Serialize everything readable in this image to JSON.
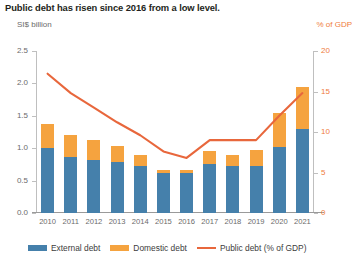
{
  "chart_data": {
    "type": "bar",
    "title": "Public debt has risen since 2016 from a low level.",
    "ylabel": "SI$ billion",
    "ylabel_right": "% of GDP",
    "xlabel": "",
    "categories": [
      "2010",
      "2011",
      "2012",
      "2013",
      "2014",
      "2015",
      "2016",
      "2017",
      "2018",
      "2019",
      "2020",
      "2021"
    ],
    "ylim": [
      0,
      2.5
    ],
    "ylim_right": [
      0,
      20
    ],
    "yticks": [
      "0.0",
      "0.5",
      "1.0",
      "1.5",
      "2.0",
      "2.5"
    ],
    "yticks_right": [
      "0",
      "5",
      "10",
      "15",
      "20"
    ],
    "grid": false,
    "legend_position": "bottom",
    "series": [
      {
        "name": "External debt",
        "type": "bar",
        "color": "#4580ab",
        "axis": "left",
        "values": [
          1.0,
          0.86,
          0.82,
          0.78,
          0.73,
          0.62,
          0.62,
          0.75,
          0.72,
          0.72,
          1.02,
          1.3
        ]
      },
      {
        "name": "Domestic debt",
        "type": "bar",
        "color": "#f5a33f",
        "axis": "left",
        "values": [
          0.38,
          0.34,
          0.31,
          0.26,
          0.17,
          0.05,
          0.05,
          0.21,
          0.17,
          0.25,
          0.52,
          0.65
        ]
      },
      {
        "name": "Public debt (% of GDP)",
        "type": "line",
        "color": "#e8673c",
        "axis": "right",
        "values": [
          17.2,
          14.8,
          13.0,
          11.2,
          9.6,
          7.6,
          6.8,
          9.0,
          9.0,
          9.0,
          12.0,
          14.8
        ]
      }
    ]
  },
  "legend": {
    "items": [
      {
        "label": "External debt",
        "marker": "bar-swatch",
        "color": "#4580ab"
      },
      {
        "label": "Domestic debt",
        "marker": "bar-swatch",
        "color": "#f5a33f"
      },
      {
        "label": "Public debt (% of GDP)",
        "marker": "line-swatch",
        "color": "#e8673c"
      }
    ]
  }
}
